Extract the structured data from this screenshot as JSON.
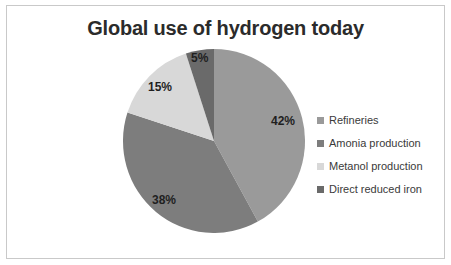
{
  "chart": {
    "title": "Global use of hydrogen today",
    "border_color": "#c9c9c9",
    "background": "#ffffff"
  },
  "legend": {
    "position": "right",
    "items": [
      {
        "label": "Refineries",
        "color": "#9a9a9a",
        "swatch_name": "legend-swatch-refineries"
      },
      {
        "label": "Amonia production",
        "color": "#7d7d7d",
        "swatch_name": "legend-swatch-amonia-production"
      },
      {
        "label": "Metanol production",
        "color": "#d8d8d8",
        "swatch_name": "legend-swatch-metanol-production"
      },
      {
        "label": "Direct reduced iron",
        "color": "#6a6a6a",
        "swatch_name": "legend-swatch-direct-reduced-iron"
      }
    ]
  },
  "slice_labels": [
    {
      "text": "42%",
      "x": 271,
      "y": 115
    },
    {
      "text": "38%",
      "x": 152,
      "y": 194
    },
    {
      "text": "15%",
      "x": 148,
      "y": 81
    },
    {
      "text": "5%",
      "x": 191,
      "y": 52
    }
  ],
  "chart_data": {
    "type": "pie",
    "title": "Global use of hydrogen today",
    "xlabel": "",
    "ylabel": "",
    "legend_position": "right",
    "grid": false,
    "units": "percent",
    "start_angle_deg": 0,
    "direction": "clockwise",
    "categories": [
      "Refineries",
      "Amonia production",
      "Metanol production",
      "Direct reduced iron"
    ],
    "values": [
      42,
      38,
      15,
      5
    ],
    "data_labels": [
      "42%",
      "38%",
      "15%",
      "5%"
    ],
    "colors": [
      "#9a9a9a",
      "#7d7d7d",
      "#d8d8d8",
      "#6a6a6a"
    ],
    "total": 100,
    "series": [
      {
        "name": "Global use of hydrogen today",
        "values": [
          42,
          38,
          15,
          5
        ]
      }
    ]
  }
}
